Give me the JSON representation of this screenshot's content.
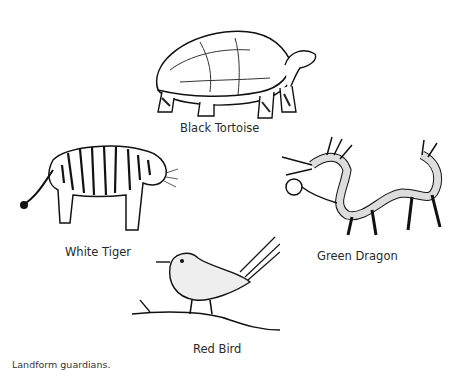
{
  "figure": {
    "caption": "Landform guardians.",
    "guardians": [
      {
        "name": "Black Tortoise",
        "position": "top",
        "icon": "tortoise-illustration"
      },
      {
        "name": "White Tiger",
        "position": "left",
        "icon": "tiger-illustration"
      },
      {
        "name": "Green Dragon",
        "position": "right",
        "icon": "dragon-illustration"
      },
      {
        "name": "Red Bird",
        "position": "bottom",
        "icon": "bird-illustration"
      }
    ]
  }
}
